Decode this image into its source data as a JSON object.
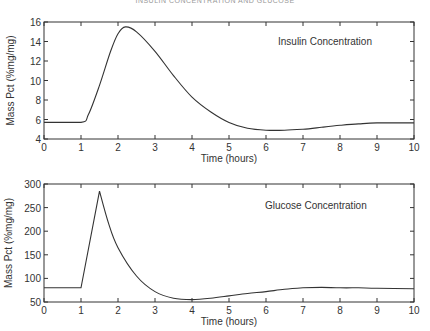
{
  "header": {
    "text": "INSULIN CONCENTRATION AND GLUCOSE"
  },
  "chart_data": [
    {
      "type": "line",
      "title": "",
      "annotation": "Insulin Concentration",
      "xlabel": "Time (hours)",
      "ylabel": "Mass Pct (%mg/mg)",
      "xlim": [
        0,
        10
      ],
      "ylim": [
        4,
        16
      ],
      "xticks": [
        0,
        1,
        2,
        3,
        4,
        5,
        6,
        7,
        8,
        9,
        10
      ],
      "yticks": [
        4,
        6,
        8,
        10,
        12,
        14,
        16
      ],
      "grid": false,
      "series": [
        {
          "name": "Insulin Concentration",
          "x": [
            0,
            1,
            1.2,
            1.5,
            1.8,
            2,
            2.2,
            2.5,
            3,
            3.5,
            4,
            4.5,
            5,
            5.5,
            6,
            6.5,
            7,
            7.5,
            8,
            8.5,
            9,
            10
          ],
          "y": [
            5.7,
            5.7,
            6.5,
            9.5,
            13,
            14.8,
            15.5,
            15,
            13,
            10.5,
            8.3,
            6.8,
            5.7,
            5.1,
            4.9,
            4.9,
            5.0,
            5.2,
            5.4,
            5.55,
            5.65,
            5.65
          ]
        }
      ]
    },
    {
      "type": "line",
      "title": "",
      "annotation": "Glucose Concentration",
      "xlabel": "Time (hours)",
      "ylabel": "Mass Pct (%mg/mg)",
      "xlim": [
        0,
        10
      ],
      "ylim": [
        50,
        300
      ],
      "xticks": [
        0,
        1,
        2,
        3,
        4,
        5,
        6,
        7,
        8,
        9,
        10
      ],
      "yticks": [
        50,
        100,
        150,
        200,
        250,
        300
      ],
      "grid": false,
      "series": [
        {
          "name": "Glucose Concentration",
          "x": [
            0,
            1,
            1.5,
            1.75,
            2,
            2.5,
            3,
            3.5,
            4,
            4.5,
            5,
            5.5,
            6,
            6.5,
            7,
            7.5,
            8,
            8.5,
            9,
            10
          ],
          "y": [
            80,
            80,
            285,
            215,
            165,
            105,
            72,
            58,
            55,
            58,
            63,
            68,
            72,
            77,
            80,
            81,
            80,
            80,
            79,
            78
          ]
        }
      ]
    }
  ]
}
